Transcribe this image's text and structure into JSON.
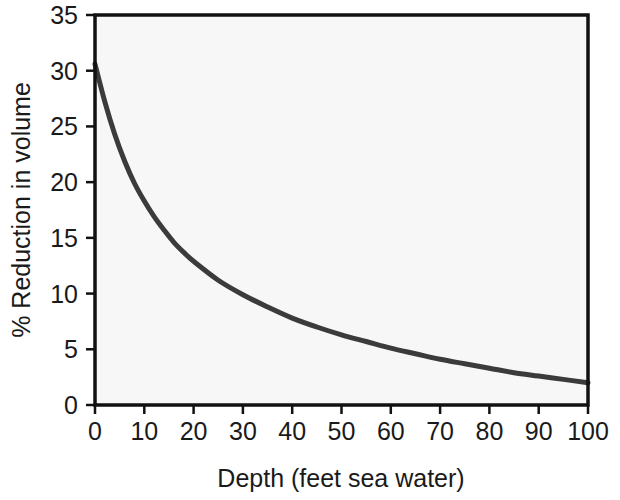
{
  "chart_data": {
    "type": "line",
    "title": "",
    "xlabel": "Depth (feet sea water)",
    "ylabel": "% Reduction in volume",
    "xlim": [
      0,
      100
    ],
    "ylim": [
      0,
      35
    ],
    "xticks": [
      0,
      10,
      20,
      30,
      40,
      50,
      60,
      70,
      80,
      90,
      100
    ],
    "yticks": [
      0,
      5,
      10,
      15,
      20,
      25,
      30,
      35
    ],
    "xtick_labels": [
      "0",
      "10",
      "20",
      "30",
      "40",
      "50",
      "60",
      "70",
      "80",
      "90",
      "100"
    ],
    "ytick_labels": [
      "0",
      "5",
      "10",
      "15",
      "20",
      "25",
      "30",
      "35"
    ],
    "grid": false,
    "legend": false,
    "series": [
      {
        "name": "Gas volume reduction vs depth",
        "color": "#3b3b3b",
        "line_width": 5,
        "x": [
          0,
          2,
          4,
          6,
          8,
          10,
          12,
          14,
          16,
          18,
          20,
          25,
          30,
          35,
          40,
          45,
          50,
          55,
          60,
          65,
          70,
          75,
          80,
          85,
          90,
          95,
          100
        ],
        "y": [
          30.6,
          27.2,
          24.3,
          21.9,
          19.9,
          18.3,
          16.9,
          15.7,
          14.6,
          13.7,
          12.9,
          11.2,
          9.9,
          8.8,
          7.8,
          7.0,
          6.3,
          5.7,
          5.1,
          4.6,
          4.1,
          3.7,
          3.3,
          2.9,
          2.6,
          2.3,
          2.0
        ]
      }
    ]
  },
  "style": {
    "plot_background": "#f7f7f7",
    "axis_color": "#111111",
    "text_color": "#1a1a1a",
    "page_background": "#ffffff"
  },
  "geometry": {
    "plot_left": 95,
    "plot_right": 588,
    "plot_top": 15,
    "plot_bottom": 405,
    "tick_length": 9
  }
}
